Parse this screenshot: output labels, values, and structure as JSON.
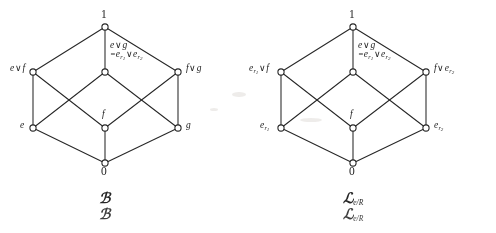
{
  "figure": {
    "kind": "two-lattice-hasse-diagrams",
    "background": "#ffffff",
    "ink_color": "#2b2b2b"
  },
  "diagrams": [
    {
      "id": "left",
      "caption": "B",
      "caption_subscript": "",
      "caption_repeated": true,
      "nodes": [
        {
          "id": "top",
          "label": "1",
          "x": 105,
          "y": 27,
          "label_pos": "above"
        },
        {
          "id": "upper-left",
          "label": "e∨f",
          "x": 33,
          "y": 72,
          "label_pos": "left"
        },
        {
          "id": "upper-center",
          "label": "e∨g",
          "label_line2": "=e_r1 ∨ e_r2",
          "x": 105,
          "y": 72,
          "label_pos": "right-above"
        },
        {
          "id": "upper-right",
          "label": "f∨g",
          "x": 178,
          "y": 72,
          "label_pos": "right"
        },
        {
          "id": "lower-left",
          "label": "e",
          "x": 33,
          "y": 128,
          "label_pos": "left"
        },
        {
          "id": "lower-center",
          "label": "f",
          "x": 105,
          "y": 128,
          "label_pos": "above"
        },
        {
          "id": "lower-right",
          "label": "g",
          "x": 178,
          "y": 128,
          "label_pos": "right"
        },
        {
          "id": "bottom",
          "label": "0",
          "x": 105,
          "y": 163,
          "label_pos": "below"
        }
      ],
      "edges": [
        [
          "top",
          "upper-left"
        ],
        [
          "top",
          "upper-center"
        ],
        [
          "top",
          "upper-right"
        ],
        [
          "upper-left",
          "lower-left"
        ],
        [
          "upper-left",
          "lower-center"
        ],
        [
          "upper-center",
          "lower-left"
        ],
        [
          "upper-center",
          "lower-right"
        ],
        [
          "upper-right",
          "lower-center"
        ],
        [
          "upper-right",
          "lower-right"
        ],
        [
          "lower-left",
          "bottom"
        ],
        [
          "lower-center",
          "bottom"
        ],
        [
          "lower-right",
          "bottom"
        ]
      ]
    },
    {
      "id": "right",
      "caption": "L",
      "caption_subscript": "e/R",
      "caption_repeated": true,
      "nodes": [
        {
          "id": "top",
          "label": "1",
          "x": 105,
          "y": 27,
          "label_pos": "above"
        },
        {
          "id": "upper-left",
          "label": "e_r1∨f",
          "x": 33,
          "y": 72,
          "label_pos": "left"
        },
        {
          "id": "upper-center",
          "label": "e∨g",
          "label_line2": "=e_r1 ∨ e_r2",
          "x": 105,
          "y": 72,
          "label_pos": "right-above"
        },
        {
          "id": "upper-right",
          "label": "f∨e_r2",
          "x": 178,
          "y": 72,
          "label_pos": "right"
        },
        {
          "id": "lower-left",
          "label": "e_r1",
          "x": 33,
          "y": 128,
          "label_pos": "left"
        },
        {
          "id": "lower-center",
          "label": "f",
          "x": 105,
          "y": 128,
          "label_pos": "above"
        },
        {
          "id": "lower-right",
          "label": "e_r2",
          "x": 178,
          "y": 128,
          "label_pos": "right"
        },
        {
          "id": "bottom",
          "label": "0",
          "x": 105,
          "y": 163,
          "label_pos": "below"
        }
      ],
      "edges": [
        [
          "top",
          "upper-left"
        ],
        [
          "top",
          "upper-center"
        ],
        [
          "top",
          "upper-right"
        ],
        [
          "upper-left",
          "lower-left"
        ],
        [
          "upper-left",
          "lower-center"
        ],
        [
          "upper-center",
          "lower-left"
        ],
        [
          "upper-center",
          "lower-right"
        ],
        [
          "upper-right",
          "lower-center"
        ],
        [
          "upper-right",
          "lower-right"
        ],
        [
          "lower-left",
          "bottom"
        ],
        [
          "lower-center",
          "bottom"
        ],
        [
          "lower-right",
          "bottom"
        ]
      ]
    }
  ],
  "left": {
    "top_label": "1",
    "bottom_label": "0",
    "upper_left_label": "e",
    "upper_left_op": "∨",
    "upper_left_label2": "f",
    "upper_right_label": "f",
    "upper_right_op": "∨",
    "upper_right_label2": "g",
    "center_line1_a": "e",
    "center_line1_op": "∨",
    "center_line1_b": "g",
    "center_line2_eq": "=",
    "center_line2_a": "e",
    "center_line2_a_sub": "r",
    "center_line2_a_sub2": "1",
    "center_line2_op": "∨",
    "center_line2_b": "e",
    "center_line2_b_sub": "r",
    "center_line2_b_sub2": "2",
    "lower_left_label": "e",
    "lower_center_label": "f",
    "lower_right_label": "g",
    "caption_script": "ℬ",
    "caption_script_ghost": "ℬ"
  },
  "right": {
    "top_label": "1",
    "bottom_label": "0",
    "upper_left_label": "e",
    "upper_left_sub": "r",
    "upper_left_sub2": "1",
    "upper_left_op": "∨",
    "upper_left_label2": "f",
    "upper_right_label": "f",
    "upper_right_op": "∨",
    "upper_right_label2": "e",
    "upper_right_sub": "r",
    "upper_right_sub2": "2",
    "center_line1_a": "e",
    "center_line1_op": "∨",
    "center_line1_b": "g",
    "center_line2_eq": "=",
    "center_line2_a": "e",
    "center_line2_a_sub": "r",
    "center_line2_a_sub2": "1",
    "center_line2_op": "∨",
    "center_line2_b": "e",
    "center_line2_b_sub": "r",
    "center_line2_b_sub2": "2",
    "lower_left_label": "e",
    "lower_left_sub": "r",
    "lower_left_sub2": "1",
    "lower_center_label": "f",
    "lower_right_label": "e",
    "lower_right_sub": "r",
    "lower_right_sub2": "2",
    "caption_script": "ℒ",
    "caption_sub": "e/R",
    "caption_script_ghost": "ℒ",
    "caption_sub_ghost": "e/R"
  }
}
